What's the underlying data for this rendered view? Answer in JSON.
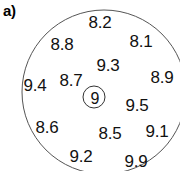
{
  "panel": {
    "label": "a)",
    "background_color": "#ffffff",
    "outline_color": "#555555",
    "text_color": "#111111"
  },
  "chart_data": {
    "type": "scatter",
    "title": "a)",
    "subtitle": "",
    "xlabel": "",
    "ylabel": "",
    "grid": false,
    "legend": null,
    "axis_visible": false,
    "boundary": {
      "shape": "circle",
      "center_x": 104,
      "center_y": 92,
      "radius": 82,
      "stroke": "#555555",
      "stroke_width": 1,
      "clipped_edges": [
        "right",
        "bottom"
      ]
    },
    "center_marker": {
      "label": "9",
      "circled": true,
      "x": 95,
      "y": 98
    },
    "labels": [
      "8.2",
      "8.8",
      "8.1",
      "9.3",
      "9.4",
      "8.7",
      "8.9",
      "9",
      "9.5",
      "8.6",
      "8.5",
      "9.1",
      "9.2",
      "9.9"
    ],
    "values": [
      8.2,
      8.8,
      8.1,
      9.3,
      9.4,
      8.7,
      8.9,
      9,
      9.5,
      8.6,
      8.5,
      9.1,
      9.2,
      9.9
    ],
    "points": [
      {
        "label": "8.2",
        "value": 8.2,
        "x": 100,
        "y": 22
      },
      {
        "label": "8.8",
        "value": 8.8,
        "x": 62,
        "y": 44
      },
      {
        "label": "8.1",
        "value": 8.1,
        "x": 141,
        "y": 41
      },
      {
        "label": "9.3",
        "value": 9.3,
        "x": 108,
        "y": 65
      },
      {
        "label": "9.4",
        "value": 9.4,
        "x": 35,
        "y": 85
      },
      {
        "label": "8.7",
        "value": 8.7,
        "x": 71,
        "y": 80
      },
      {
        "label": "8.9",
        "value": 8.9,
        "x": 162,
        "y": 77
      },
      {
        "label": "9.5",
        "value": 9.5,
        "x": 137,
        "y": 105
      },
      {
        "label": "8.6",
        "value": 8.6,
        "x": 47,
        "y": 127
      },
      {
        "label": "8.5",
        "value": 8.5,
        "x": 110,
        "y": 133
      },
      {
        "label": "9.1",
        "value": 9.1,
        "x": 157,
        "y": 131
      },
      {
        "label": "9.2",
        "value": 9.2,
        "x": 81,
        "y": 156
      },
      {
        "label": "9.9",
        "value": 9.9,
        "x": 136,
        "y": 161
      }
    ]
  }
}
